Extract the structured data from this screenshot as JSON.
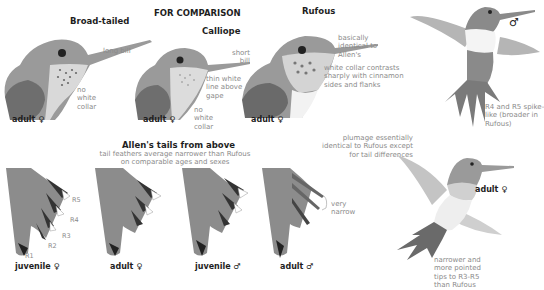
{
  "header": {
    "comparison_title": "FOR COMPARISON"
  },
  "heads": [
    {
      "species": "Broad-tailed",
      "age": "adult",
      "sex_symbol": "♀",
      "notes": [
        "long bill",
        "no white collar"
      ]
    },
    {
      "species": "Calliope",
      "age": "adult",
      "sex_symbol": "♀",
      "notes": [
        "short bill",
        "thin white line above gape",
        "no white collar"
      ]
    },
    {
      "species": "Rufous",
      "age": "adult",
      "sex_symbol": "♀",
      "notes": [
        "basically identical to Allen's",
        "white collar contrasts sharply with cinnamon sides and flanks"
      ]
    }
  ],
  "tails_section": {
    "title": "Allen's tails from above",
    "subtitle_line1": "tail feathers average narrower than Rufous",
    "subtitle_line2": "on comparable ages and sexes",
    "feather_labels": [
      "R1",
      "R2",
      "R3",
      "R4",
      "R5"
    ],
    "tails": [
      {
        "age": "juvenile",
        "sex_symbol": "♀"
      },
      {
        "age": "adult",
        "sex_symbol": "♀"
      },
      {
        "age": "juvenile",
        "sex_symbol": "♂"
      },
      {
        "age": "adult",
        "sex_symbol": "♂",
        "note": "very narrow"
      }
    ]
  },
  "flying_birds": {
    "male": {
      "sex_symbol": "♂",
      "note_lines": [
        "R4 and R5 spike-",
        "like (broader in",
        "Rufous)"
      ]
    },
    "female": {
      "age": "adult",
      "sex_symbol": "♀",
      "note_lines": [
        "narrower and",
        "more pointed",
        "tips to R3-R5",
        "than Rufous"
      ]
    }
  },
  "plumage_note_lines": [
    "plumage essentially",
    "identical to Rufous except",
    "for tail differences"
  ],
  "colors": {
    "text_dark": "#1e1e1e",
    "note_gray": "#8a8a8a",
    "plumage_dark": "#555555",
    "plumage_mid": "#8c8c8c",
    "plumage_light": "#d8d8d8",
    "background": "#ffffff"
  }
}
